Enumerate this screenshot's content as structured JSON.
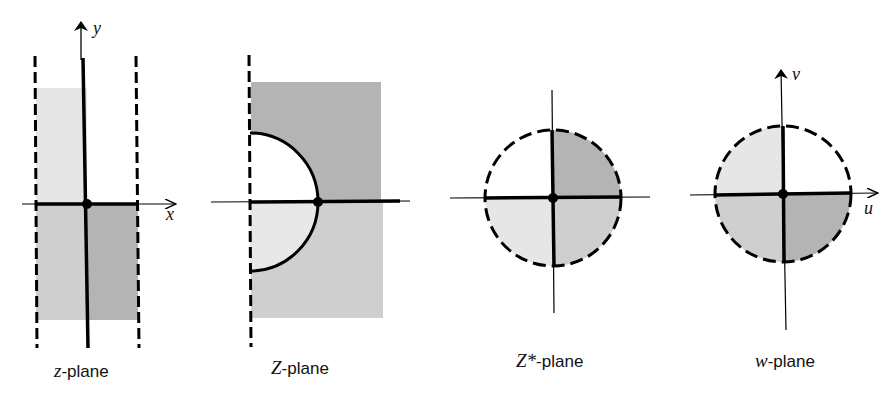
{
  "figure": {
    "colors": {
      "background": "#ffffff",
      "ink": "#000000",
      "shade_light": "#e6e6e6",
      "shade_mid": "#cfcfcf",
      "shade_dark": "#b4b4b4"
    },
    "panels": [
      {
        "id": "z-plane",
        "label_var": "z",
        "label_suffix": "-plane",
        "axis_labels": {
          "horizontal": "x",
          "vertical": "y"
        },
        "boundary": "two dashed vertical lines (strip)",
        "regions": [
          {
            "quadrant": "upper-left",
            "shade": "light"
          },
          {
            "quadrant": "upper-right",
            "shade": "none"
          },
          {
            "quadrant": "lower-left",
            "shade": "mid"
          },
          {
            "quadrant": "lower-right",
            "shade": "dark"
          }
        ]
      },
      {
        "id": "Z-plane",
        "label_var": "Z",
        "label_suffix": "-plane",
        "axis_labels": {
          "horizontal": "",
          "vertical": ""
        },
        "boundary": "dashed vertical line with semicircle",
        "regions": [
          {
            "region": "upper outside semicircle",
            "shade": "dark"
          },
          {
            "region": "upper inside semicircle",
            "shade": "none"
          },
          {
            "region": "lower outside semicircle",
            "shade": "mid"
          },
          {
            "region": "lower inside semicircle",
            "shade": "light"
          }
        ]
      },
      {
        "id": "Zstar-plane",
        "label_var": "Z*",
        "label_suffix": "-plane",
        "axis_labels": {
          "horizontal": "",
          "vertical": ""
        },
        "boundary": "dashed circle",
        "regions": [
          {
            "quadrant": "upper-left",
            "shade": "none"
          },
          {
            "quadrant": "upper-right",
            "shade": "dark"
          },
          {
            "quadrant": "lower-left",
            "shade": "light"
          },
          {
            "quadrant": "lower-right",
            "shade": "mid"
          }
        ]
      },
      {
        "id": "w-plane",
        "label_var": "w",
        "label_suffix": "-plane",
        "axis_labels": {
          "horizontal": "u",
          "vertical": "v"
        },
        "boundary": "dashed circle",
        "regions": [
          {
            "quadrant": "upper-left",
            "shade": "light"
          },
          {
            "quadrant": "upper-right",
            "shade": "none"
          },
          {
            "quadrant": "lower-left",
            "shade": "mid"
          },
          {
            "quadrant": "lower-right",
            "shade": "dark"
          }
        ]
      }
    ]
  }
}
